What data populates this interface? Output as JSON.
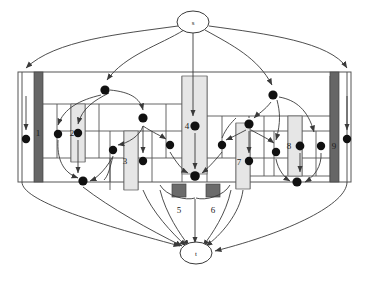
{
  "figure": {
    "background": "#ffffff",
    "width": 371,
    "height": 282
  },
  "colors": {
    "stroke": "#3a3a3a",
    "frame": "#555555",
    "node_dark": "#666666",
    "node_light": "#e6e6e6",
    "dot": "#111111",
    "square": "#6b6b6b",
    "text": "#1a1a1a"
  },
  "terminals": {
    "source": {
      "label": "s",
      "cx": 193,
      "cy": 22,
      "rx": 16,
      "ry": 11
    },
    "sink": {
      "label": "t",
      "cx": 196,
      "cy": 253,
      "rx": 16,
      "ry": 11
    }
  },
  "nodes": [
    {
      "id": 1,
      "label": "1",
      "shape": "bar-dark",
      "x": 34,
      "y": 72,
      "w": 9,
      "h": 110,
      "label_x": 38,
      "label_y": 133
    },
    {
      "id": 2,
      "label": "2",
      "shape": "bar-light",
      "x": 71,
      "y": 104,
      "w": 14,
      "h": 58,
      "label_x": 78,
      "label_y": 134
    },
    {
      "id": 3,
      "label": "3",
      "shape": "bar-light",
      "x": 124,
      "y": 131,
      "w": 14,
      "h": 59,
      "label_x": 131,
      "label_y": 160
    },
    {
      "id": 4,
      "label": "4",
      "shape": "bar-light",
      "x": 182,
      "y": 76,
      "w": 25,
      "h": 98,
      "label_x": 188,
      "label_y": 126
    },
    {
      "id": 5,
      "label": "5",
      "shape": "square",
      "x": 172,
      "y": 184,
      "w": 14,
      "h": 13,
      "label_x": 178,
      "label_y": 211
    },
    {
      "id": 6,
      "label": "6",
      "shape": "square",
      "x": 206,
      "y": 184,
      "w": 14,
      "h": 13,
      "label_x": 212,
      "label_y": 211
    },
    {
      "id": 7,
      "label": "7",
      "shape": "bar-light",
      "x": 236,
      "y": 123,
      "w": 14,
      "h": 66,
      "label_x": 241,
      "label_y": 162
    },
    {
      "id": 8,
      "label": "8",
      "shape": "bar-light",
      "x": 288,
      "y": 116,
      "w": 14,
      "h": 60,
      "label_x": 291,
      "label_y": 146
    },
    {
      "id": 9,
      "label": "9",
      "shape": "bar-dark",
      "x": 330,
      "y": 76,
      "w": 9,
      "h": 110,
      "label_x": 334,
      "label_y": 146
    }
  ],
  "junction_dots": [
    {
      "cx": 26,
      "cy": 139
    },
    {
      "cx": 58,
      "cy": 134
    },
    {
      "cx": 78,
      "cy": 133
    },
    {
      "cx": 105,
      "cy": 90
    },
    {
      "cx": 113,
      "cy": 150
    },
    {
      "cx": 143,
      "cy": 118
    },
    {
      "cx": 143,
      "cy": 161
    },
    {
      "cx": 170,
      "cy": 145
    },
    {
      "cx": 83,
      "cy": 181
    },
    {
      "cx": 195,
      "cy": 126
    },
    {
      "cx": 195,
      "cy": 176
    },
    {
      "cx": 222,
      "cy": 145
    },
    {
      "cx": 249,
      "cy": 161
    },
    {
      "cx": 249,
      "cy": 124
    },
    {
      "cx": 273,
      "cy": 95
    },
    {
      "cx": 276,
      "cy": 152
    },
    {
      "cx": 300,
      "cy": 146
    },
    {
      "cx": 297,
      "cy": 182
    },
    {
      "cx": 321,
      "cy": 146
    },
    {
      "cx": 347,
      "cy": 139
    }
  ],
  "frame": {
    "outer": {
      "x": 18,
      "y": 72,
      "w": 333,
      "h": 110
    },
    "inner_rows": [
      {
        "y": 104,
        "x1": 43,
        "x2": 182
      },
      {
        "y": 131,
        "x1": 57,
        "x2": 182
      },
      {
        "y": 158,
        "x1": 43,
        "x2": 182
      },
      {
        "y": 116,
        "x1": 207,
        "x2": 330
      },
      {
        "y": 131,
        "x1": 250,
        "x2": 330
      },
      {
        "y": 158,
        "x1": 207,
        "x2": 330
      },
      {
        "y": 176,
        "x1": 250,
        "x2": 330
      }
    ]
  },
  "edge_groups": {
    "source_fanout": [
      "s-to-1",
      "s-to-2",
      "s-to-4",
      "s-to-8",
      "s-to-9"
    ],
    "sink_fanin": [
      "1-to-t",
      "2-to-t",
      "3-to-t",
      "5-to-t",
      "6-to-t",
      "7-to-t",
      "9-to-t"
    ]
  },
  "caption": ""
}
